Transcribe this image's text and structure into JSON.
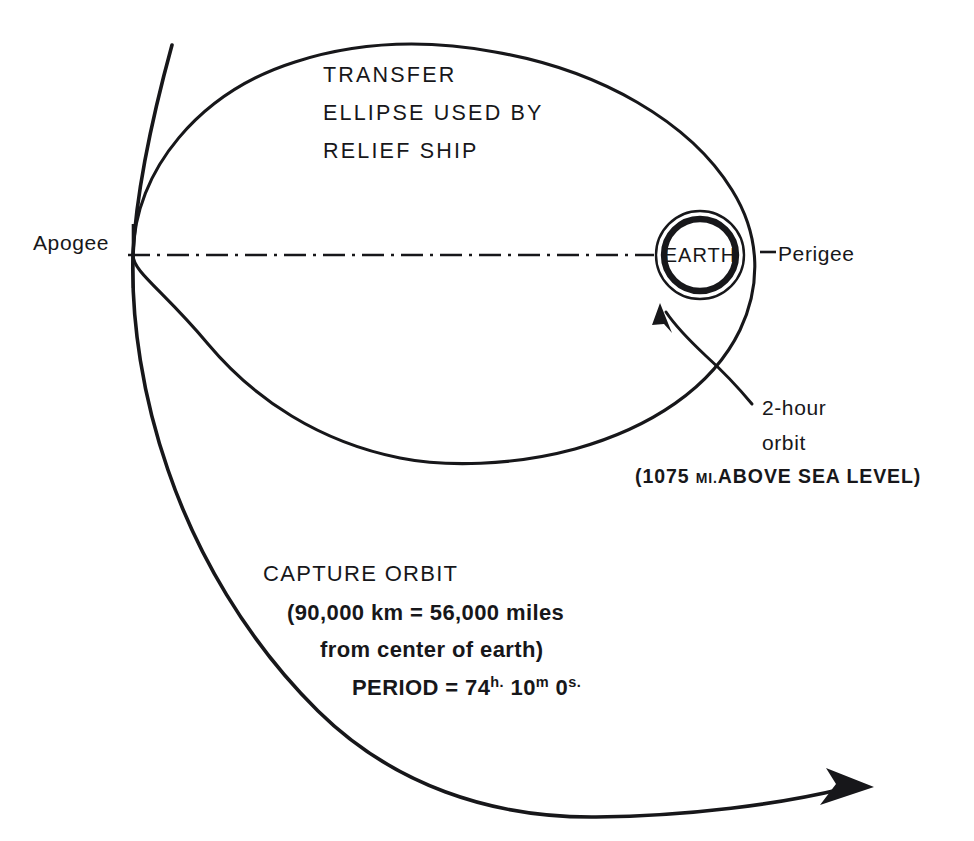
{
  "figure": {
    "kind": "orbital-mechanics-diagram",
    "background_color": "#ffffff",
    "ink_color": "#17171a"
  },
  "labels": {
    "transfer_line1": "TRANSFER",
    "transfer_line2": "ELLIPSE  USED BY",
    "transfer_line3": "RELIEF  SHIP",
    "apogee": "Apogee",
    "perigee": "Perigee",
    "earth": "EARTH",
    "two_hour_line1": "2-hour",
    "two_hour_line2": "orbit",
    "altitude_open": "(1075 ",
    "altitude_small": "MI.",
    "altitude_rest": "ABOVE SEA LEVEL)",
    "capture_title": "CAPTURE ORBIT",
    "capture_line2": "(90,000 km = 56,000 miles",
    "capture_line3": "from center of earth)",
    "period_prefix": "PERIOD = 74",
    "period_h": "h.",
    "period_minutes": " 10",
    "period_m": "m",
    "period_seconds": " 0",
    "period_s": "s."
  },
  "geometry": {
    "apogee_point": {
      "x": 133,
      "y": 255
    },
    "perigee_point": {
      "x": 755,
      "y": 255
    },
    "earth_center": {
      "x": 1121,
      "y": 470
    },
    "earth_radius": 36,
    "orbit_radius": 44,
    "centerline": {
      "x1": 125,
      "x2": 1035,
      "y": 255
    },
    "capture_arrow_tip": {
      "x": 872,
      "y": 789
    },
    "leader_arrow_tip": {
      "x": 661,
      "y": 306
    }
  },
  "annotations": [
    {
      "name": "transfer-ellipse",
      "description": "Transfer ellipse used by relief ship"
    },
    {
      "name": "capture-orbit",
      "description": "Capture orbit, 90,000 km from center of earth"
    },
    {
      "name": "two-hour-orbit",
      "description": "2-hour orbit 1075 mi above sea level"
    },
    {
      "name": "earth",
      "description": "Earth at focus of transfer ellipse"
    }
  ]
}
